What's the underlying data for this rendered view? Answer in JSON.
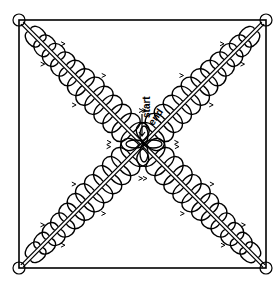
{
  "diagram": {
    "frame": {
      "x": 19,
      "y": 20,
      "width": 247,
      "height": 248,
      "stroke": "#000000"
    },
    "center": {
      "x": 144,
      "y": 144
    },
    "arms": [
      {
        "name": "diagonal-top-left-to-bottom-right",
        "from": [
          22,
          23
        ],
        "to": [
          264,
          266
        ]
      },
      {
        "name": "diagonal-top-right-to-bottom-left",
        "from": [
          263,
          23
        ],
        "to": [
          22,
          266
        ]
      }
    ],
    "loops_per_side": 12,
    "labels": {
      "start": "start",
      "end": "end"
    },
    "ink_color": "#000000",
    "paper_color": "#ffffff"
  }
}
